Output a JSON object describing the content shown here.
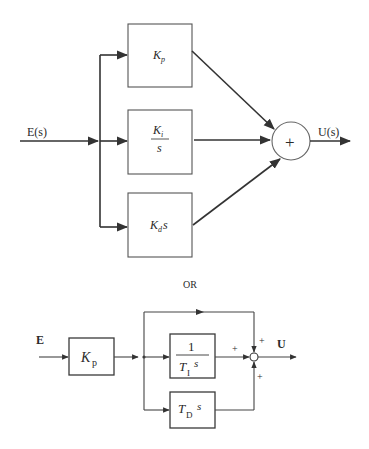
{
  "diagram_top": {
    "title": "Parallel PID controller",
    "input_label": "E(s)",
    "output_label": "U(s)",
    "blocks": [
      {
        "name": "proportional",
        "main": "K",
        "sub": "p"
      },
      {
        "name": "integral",
        "numerator_main": "K",
        "numerator_sub": "i",
        "denominator": "s"
      },
      {
        "name": "derivative",
        "main": "K",
        "sub": "d",
        "suffix": "s"
      }
    ],
    "summing_junction_symbol": "+"
  },
  "separator": {
    "label": "OR"
  },
  "diagram_bottom": {
    "title": "Ideal (standard) PID controller",
    "input_label": "E",
    "output_label": "U",
    "gain_block": {
      "main": "K",
      "sub": "p"
    },
    "integral_block": {
      "numerator": "1",
      "den_main": "T",
      "den_sub": "I",
      "den_suffix": "s"
    },
    "derivative_block": {
      "main": "T",
      "sub": "D",
      "suffix": "s"
    },
    "junction_signs": {
      "top": "+",
      "left": "+",
      "bottom": "+"
    }
  },
  "colors": {
    "line": "#333333",
    "box_border": "#555555",
    "text": "#2a2a2a",
    "background": "#ffffff"
  }
}
